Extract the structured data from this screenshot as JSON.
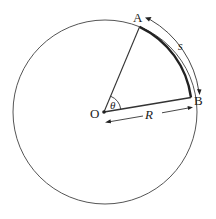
{
  "diagram": {
    "labels": {
      "point_a": "A",
      "point_b": "B",
      "origin": "O",
      "angle": "θ",
      "radius": "R",
      "arc_length": "s"
    },
    "colors": {
      "stroke": "#333333",
      "arc": "#222222",
      "background": "#ffffff"
    }
  }
}
